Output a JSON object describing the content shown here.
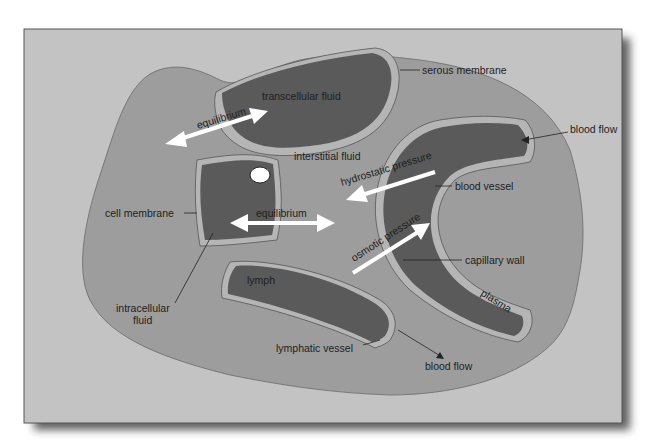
{
  "diagram": {
    "colors": {
      "page_background": "#ffffff",
      "frame_background": "#c3c3c3",
      "body_fluid_blob": "#9d9d9d",
      "fluid_compartment": "#5a5a5a",
      "membrane": "#b5b5b5",
      "arrow": "#ffffff",
      "text": "#1e1e1e"
    },
    "compartments": {
      "transcellular": "transcellular fluid",
      "interstitial": "interstitial fluid",
      "intracellular_line1": "intracellular",
      "intracellular_line2": "fluid",
      "lymph": "lymph",
      "plasma": "plasma"
    },
    "callouts": {
      "serous_membrane": "serous membrane",
      "blood_flow_top": "blood flow",
      "blood_vessel": "blood vessel",
      "capillary_wall": "capillary wall",
      "cell_membrane": "cell membrane",
      "lymphatic_vessel": "lymphatic vessel",
      "blood_flow_bottom": "blood flow"
    },
    "arrows": {
      "equilibrium_top": "equilibrium",
      "equilibrium_middle": "equilibrium",
      "hydrostatic": "hydrostatic pressure",
      "osmotic": "osmotic pressure"
    }
  }
}
